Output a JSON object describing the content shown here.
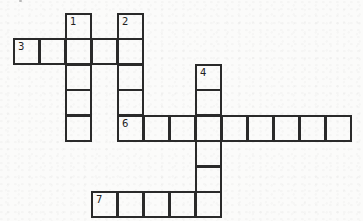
{
  "puzzle": {
    "type": "crossword",
    "cell_size": 26,
    "origin": {
      "x": 13,
      "y": 13
    },
    "col_x": [
      13,
      39,
      65,
      91,
      117,
      143,
      169,
      195,
      221,
      247,
      273,
      299,
      325
    ],
    "row_y": [
      13,
      38,
      64,
      89,
      115,
      140,
      166,
      191
    ],
    "line_color": "#2a2a2a",
    "background_color": "#fbfbfa",
    "entries": [
      {
        "number": "1",
        "direction": "down",
        "row": 0,
        "col": 2,
        "length": 5
      },
      {
        "number": "2",
        "direction": "down",
        "row": 0,
        "col": 4,
        "length": 5
      },
      {
        "number": "3",
        "direction": "across",
        "row": 1,
        "col": 0,
        "length": 5
      },
      {
        "number": "4",
        "direction": "down",
        "row": 2,
        "col": 7,
        "length": 6
      },
      {
        "number": "6",
        "direction": "across",
        "row": 4,
        "col": 4,
        "length": 9
      },
      {
        "number": "7",
        "direction": "across",
        "row": 7,
        "col": 3,
        "length": 5
      }
    ],
    "numbers": {
      "n1": "1",
      "n2": "2",
      "n3": "3",
      "n4": "4",
      "n6": "6",
      "n7": "7"
    }
  }
}
